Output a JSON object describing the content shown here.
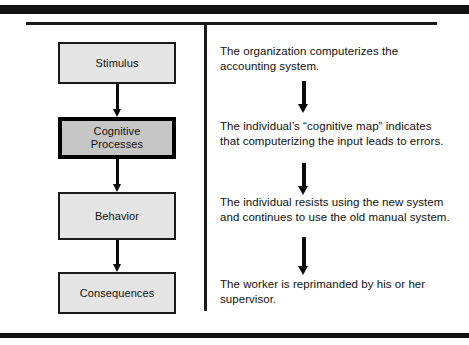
{
  "figure": {
    "type": "flow-diagram",
    "colors": {
      "rule": "#111111",
      "box_fill": "#e4e4e4",
      "box_fill_emphasis": "#c6c6c6",
      "box_border": "#1a1a1a",
      "arrow": "#0a0a0a",
      "text": "#111111",
      "background": "#ffffff"
    },
    "flow": {
      "boxes": [
        {
          "label": "Stimulus",
          "emphasis": false
        },
        {
          "label": "Cognitive\nProcesses",
          "emphasis": true
        },
        {
          "label": "Behavior",
          "emphasis": false
        },
        {
          "label": "Consequences",
          "emphasis": false
        }
      ],
      "arrow_icon": "down-arrow-icon",
      "arrow_count": 3
    },
    "example": {
      "steps": [
        "The organization computerizes the accounting system.",
        "The individual’s “cognitive map” indicates that computerizing the input leads to errors.",
        "The individual resists using the new system and continues to use the old manual system.",
        "The worker is reprimanded by his or her supervisor."
      ],
      "arrow_icon": "down-arrow-icon",
      "arrow_count": 3
    }
  }
}
